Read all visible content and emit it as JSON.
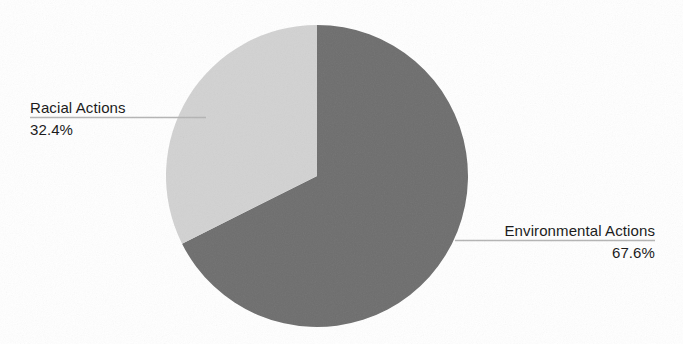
{
  "chart_data": {
    "type": "pie",
    "title": "",
    "labels": [
      "Environmental Actions",
      "Racial Actions"
    ],
    "values": [
      67.6,
      32.4
    ],
    "value_labels": [
      "67.6%",
      "32.4%"
    ],
    "units": "percent",
    "start_angle_deg": 0,
    "direction": "clockwise",
    "legend": "none",
    "grid": false,
    "slices": [
      {
        "name": "Environmental Actions",
        "value": 67.6,
        "value_label": "67.6%",
        "color": "#6e6e6e",
        "start_deg": 0,
        "end_deg": 243.36,
        "label_side": "right"
      },
      {
        "name": "Racial Actions",
        "value": 32.4,
        "value_label": "32.4%",
        "color": "#d2d2d2",
        "start_deg": 243.36,
        "end_deg": 360,
        "label_side": "left"
      }
    ]
  },
  "labels": {
    "left": {
      "name": "Racial Actions",
      "value": "32.4%"
    },
    "right": {
      "name": "Environmental Actions",
      "value": "67.6%"
    }
  },
  "colors": {
    "background": "#ffffff",
    "slice_dark": "#6e6e6e",
    "slice_light": "#d2d2d2",
    "leader_line": "#b4b4b4",
    "text": "#1c1c1c"
  }
}
